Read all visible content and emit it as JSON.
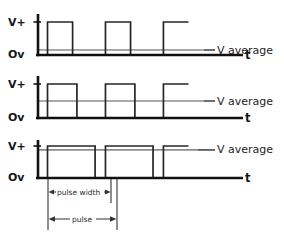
{
  "figure": {
    "background_color": "#ffffff",
    "wave_color": "#262626",
    "axis_color": "#111111",
    "average_color": "#8c8c8c",
    "dim_color": "#333333"
  },
  "labels": {
    "v_plus": "V+",
    "zero_v": "Ov",
    "time": "t",
    "v_average": "V average",
    "pulse_width": "pulse width",
    "pulse": "pulse"
  },
  "chart_data": {
    "type": "line",
    "xlabel": "t",
    "ylabel": "V",
    "ylim": [
      0,
      1
    ],
    "grid": false,
    "legend": "none",
    "y_ticks": [
      {
        "value": 0,
        "label": "Ov"
      },
      {
        "value": 1,
        "label": "V+"
      }
    ],
    "panels": [
      {
        "name": "low-duty-cycle",
        "duty_cycle_percent": 15,
        "v_average_level": 0.15,
        "average_label": "V average",
        "period": 0.333,
        "pulses": [
          {
            "start": 0.055,
            "end": 0.2
          },
          {
            "start": 0.39,
            "end": 0.535
          },
          {
            "start": 0.725,
            "end": 0.87
          }
        ],
        "series": [
          {
            "name": "pwm",
            "x": [
              0.0,
              0.055,
              0.055,
              0.2,
              0.2,
              0.39,
              0.39,
              0.535,
              0.535,
              0.725,
              0.725,
              0.87
            ],
            "values": [
              0,
              0,
              1,
              1,
              0,
              0,
              1,
              1,
              0,
              0,
              1,
              1
            ]
          },
          {
            "name": "v-average",
            "x": [
              0.0,
              1.0
            ],
            "values": [
              0.15,
              0.15
            ]
          }
        ]
      },
      {
        "name": "medium-duty-cycle",
        "duty_cycle_percent": 50,
        "v_average_level": 0.5,
        "average_label": "V average",
        "period": 0.333,
        "pulses": [
          {
            "start": 0.055,
            "end": 0.225
          },
          {
            "start": 0.39,
            "end": 0.56
          },
          {
            "start": 0.725,
            "end": 0.87
          }
        ],
        "series": [
          {
            "name": "pwm",
            "x": [
              0.0,
              0.055,
              0.055,
              0.225,
              0.225,
              0.39,
              0.39,
              0.56,
              0.56,
              0.725,
              0.725,
              0.87
            ],
            "values": [
              0,
              0,
              1,
              1,
              0,
              0,
              1,
              1,
              0,
              0,
              1,
              1
            ]
          },
          {
            "name": "v-average",
            "x": [
              0.0,
              1.0
            ],
            "values": [
              0.5,
              0.5
            ]
          }
        ]
      },
      {
        "name": "high-duty-cycle",
        "duty_cycle_percent": 85,
        "v_average_level": 0.88,
        "average_label": "V average",
        "period": 0.333,
        "pulses": [
          {
            "start": 0.055,
            "end": 0.33
          },
          {
            "start": 0.39,
            "end": 0.665
          },
          {
            "start": 0.725,
            "end": 0.87
          }
        ],
        "series": [
          {
            "name": "pwm",
            "x": [
              0.0,
              0.055,
              0.055,
              0.33,
              0.33,
              0.39,
              0.39,
              0.665,
              0.665,
              0.725,
              0.725,
              0.87
            ],
            "values": [
              0,
              0,
              1,
              1,
              0,
              0,
              1,
              1,
              0,
              0,
              1,
              1
            ]
          },
          {
            "name": "v-average",
            "x": [
              0.0,
              1.0
            ],
            "values": [
              0.88,
              0.88
            ]
          }
        ],
        "annotations": [
          {
            "name": "pulse-width",
            "label": "pulse width",
            "from": 0.055,
            "to": 0.33
          },
          {
            "name": "pulse",
            "label": "pulse",
            "from": 0.055,
            "to": 0.39
          }
        ]
      }
    ]
  }
}
